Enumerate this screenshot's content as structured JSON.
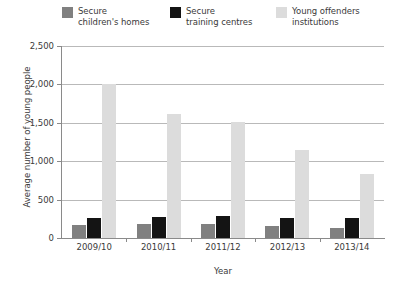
{
  "chart_data": {
    "type": "bar",
    "title": "",
    "xlabel": "Year",
    "ylabel": "Average number of young people",
    "categories": [
      "2009/10",
      "2010/11",
      "2011/12",
      "2012/13",
      "2013/14"
    ],
    "series": [
      {
        "name": "Secure children's homes",
        "color": "#808080",
        "values": [
          175,
          180,
          180,
          150,
          130
        ]
      },
      {
        "name": "Secure training centres",
        "color": "#141414",
        "values": [
          260,
          270,
          285,
          265,
          265
        ]
      },
      {
        "name": "Young offenders institutions",
        "color": "#dcdcdc",
        "values": [
          2000,
          1620,
          1510,
          1150,
          830
        ]
      }
    ],
    "ylim": [
      0,
      2500
    ],
    "ytick_values": [
      0,
      500,
      1000,
      1500,
      2000,
      2500
    ],
    "ytick_labels": [
      "0",
      "500",
      "1,000",
      "1,500",
      "2,000",
      "2,500"
    ],
    "grid": true,
    "legend_position": "top"
  },
  "legend": {
    "items": [
      {
        "label": "Secure\nchildren's homes",
        "color": "#808080"
      },
      {
        "label": "Secure\ntraining centres",
        "color": "#141414"
      },
      {
        "label": "Young offenders\ninstitutions",
        "color": "#dcdcdc"
      }
    ]
  },
  "axes": {
    "y_title": "Average number of young people",
    "x_title": "Year"
  }
}
